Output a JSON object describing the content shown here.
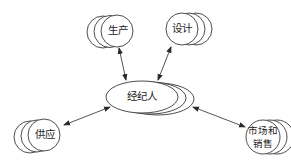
{
  "diagram": {
    "type": "hub-and-spoke relationship diagram",
    "center": {
      "id": "broker",
      "label": "经纪人",
      "shape": "stacked-ellipse",
      "cx": 142,
      "cy": 97,
      "rx": 36,
      "ry": 16,
      "stack_offset": [
        8,
        1
      ]
    },
    "nodes": [
      {
        "id": "production",
        "label": "生产",
        "shape": "stacked-circle",
        "cx": 117,
        "cy": 31,
        "r": 16,
        "stack_direction": "left"
      },
      {
        "id": "design",
        "label": "设计",
        "shape": "stacked-circle",
        "cx": 182,
        "cy": 29,
        "r": 16,
        "stack_direction": "right"
      },
      {
        "id": "supply",
        "label": "供应",
        "shape": "stacked-circle",
        "cx": 44,
        "cy": 135,
        "r": 16,
        "stack_direction": "left"
      },
      {
        "id": "marketing-sales",
        "label_line1": "市场和",
        "label_line2": "销售",
        "shape": "stacked-circle",
        "cx": 263,
        "cy": 137,
        "r": 17,
        "stack_direction": "right"
      }
    ],
    "edges": [
      {
        "from": "production",
        "to": "broker",
        "arrows": "both"
      },
      {
        "from": "design",
        "to": "broker",
        "arrows": "both"
      },
      {
        "from": "supply",
        "to": "broker",
        "arrows": "both"
      },
      {
        "from": "broker",
        "to": "marketing-sales",
        "arrows": "both"
      }
    ],
    "colors": {
      "stroke": "#3a3a3a",
      "fill": "#ffffff",
      "text": "#222222",
      "background": "#ffffff"
    }
  }
}
